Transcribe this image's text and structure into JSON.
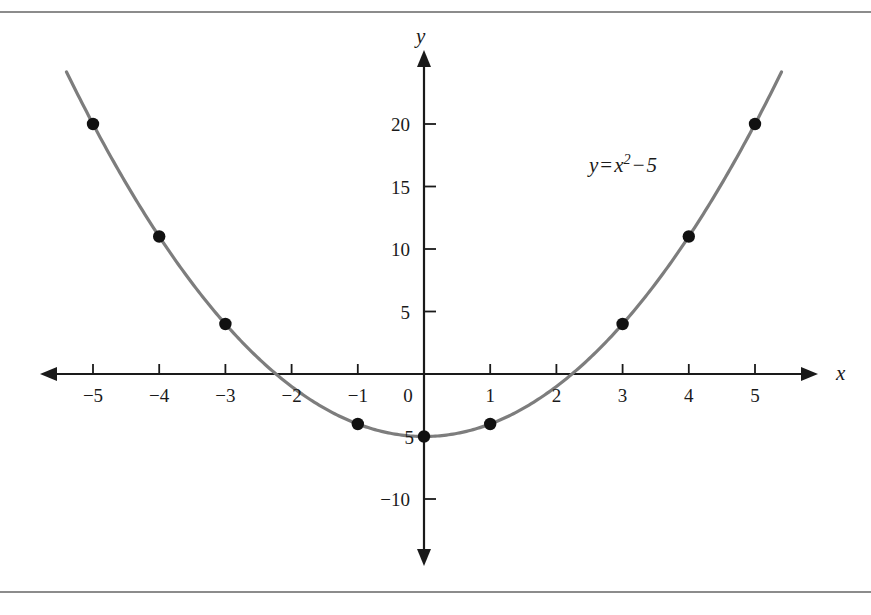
{
  "figure": {
    "background_color": "#ffffff",
    "rule_color": "#8c8c8c",
    "curve_color": "#7d7d7d",
    "point_color": "#111111",
    "axis_color": "#1a1a1a"
  },
  "labels": {
    "x_axis_name": "x",
    "y_axis_name": "y",
    "equation_lhs": "y",
    "equation_eq": "=",
    "equation_var": "x",
    "equation_exp": "2",
    "equation_minus": "−",
    "equation_const": "5",
    "equation_plain": "y = x² − 5",
    "origin": "0",
    "vertex_value": "5"
  },
  "chart_data": {
    "type": "scatter",
    "title": "",
    "subtitle": "",
    "xlabel": "x",
    "ylabel": "y",
    "annotation": "y = x² − 5",
    "function": "y = x^2 - 5",
    "grid": false,
    "legend": false,
    "axis_style": "arrows-both-directions-cartesian",
    "xlim": [
      -5.9,
      5.9
    ],
    "ylim": [
      -14.5,
      24
    ],
    "x_ticks": [
      -5,
      -4,
      -3,
      -2,
      -1,
      0,
      1,
      2,
      3,
      4,
      5
    ],
    "x_tick_labels": [
      "−5",
      "−4",
      "−3",
      "−2",
      "−1",
      "0",
      "1",
      "2",
      "3",
      "4",
      "5"
    ],
    "y_ticks": [
      20,
      15,
      10,
      5,
      -5,
      -10
    ],
    "y_tick_labels": [
      "20",
      "15",
      "10",
      "5",
      "5",
      "−10"
    ],
    "x": [
      -5,
      -4,
      -3,
      -2,
      -1,
      0,
      1,
      2,
      3,
      4,
      5
    ],
    "values": [
      20,
      11,
      4,
      -1,
      -4,
      -5,
      -4,
      -1,
      4,
      11,
      20
    ],
    "points": [
      {
        "x": -5,
        "y": 20
      },
      {
        "x": -4,
        "y": 11
      },
      {
        "x": -3,
        "y": 4
      },
      {
        "x": -1,
        "y": -4
      },
      {
        "x": 0,
        "y": -5
      },
      {
        "x": 1,
        "y": -4
      },
      {
        "x": 3,
        "y": 4
      },
      {
        "x": 4,
        "y": 11
      },
      {
        "x": 5,
        "y": 20
      }
    ],
    "series": [
      {
        "name": "y = x² − 5",
        "type": "line",
        "x": [
          -5.4,
          -5,
          -4,
          -3,
          -2,
          -1,
          0,
          1,
          2,
          3,
          4,
          5,
          5.4
        ],
        "values": [
          24.16,
          20,
          11,
          4,
          -1,
          -4,
          -5,
          -4,
          -1,
          4,
          11,
          20,
          24.16
        ]
      }
    ],
    "x_intercepts": [
      -2.236,
      2.236
    ],
    "vertex": {
      "x": 0,
      "y": -5
    }
  }
}
